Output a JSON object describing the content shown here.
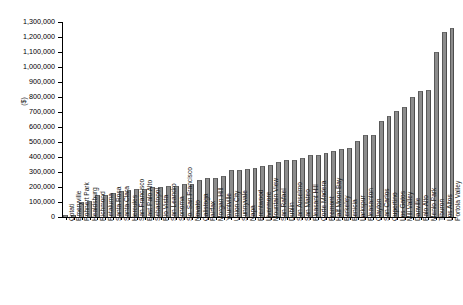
{
  "chart_data": {
    "type": "bar",
    "title": "",
    "subtitle": "",
    "xlabel": "",
    "ylabel": "($)",
    "ylim": [
      0,
      1300000
    ],
    "ytick_step": 100000,
    "grid": false,
    "legend": null,
    "bar_color": "#8c8c8c",
    "ytick_labels": [
      "1,300,000",
      "1,200,000",
      "1,100,000",
      "1,000,000",
      "900,000",
      "800,000",
      "700,000",
      "600,000",
      "500,000",
      "400,000",
      "300,000",
      "200,000",
      "100,000",
      "0"
    ],
    "ytick_values": [
      1300000,
      1200000,
      1100000,
      1000000,
      900000,
      800000,
      700000,
      600000,
      500000,
      400000,
      300000,
      200000,
      100000,
      0
    ],
    "categories": [
      "Cotati",
      "Emeryville",
      "Rohnert Park",
      "Healdsburg",
      "Richmond",
      "Petaluma",
      "Santa Rosa",
      "Santa Clara",
      "Hercules",
      "San Francisco",
      "East Palo Alto",
      "Sebastopol",
      "Rio Vista",
      "San Leandro",
      "Sonoma",
      "So. San Francisco",
      "Novato",
      "Calistoga",
      "Fairfax",
      "Morgan Hill",
      "Yountville",
      "Union City",
      "Sunnyvale",
      "Napa",
      "Brentwood",
      "Livermore",
      "Mountain View",
      "San Rafael",
      "Dublin",
      "San Anselmo",
      "San Mateo",
      "Pleasant Hill",
      "Corte Madera",
      "Fremont",
      "Half Moon Bay",
      "Berkeley",
      "Benicia",
      "Larkspur",
      "Pleasanton",
      "Clayton",
      "San Carlos",
      "Cupertino",
      "Los Gatos",
      "Mill Valley",
      "Danville",
      "Palo Alto",
      "Menlo Park",
      "Tiburon",
      "Los Altos",
      "Portola Valley"
    ],
    "values": [
      12000,
      15000,
      103000,
      107000,
      146000,
      150000,
      163000,
      176000,
      179000,
      185000,
      189000,
      197000,
      201000,
      205000,
      210000,
      219000,
      222000,
      248000,
      261000,
      262000,
      275000,
      311000,
      314000,
      322000,
      330000,
      337000,
      348000,
      367000,
      380000,
      383000,
      394000,
      412000,
      415000,
      424000,
      442000,
      456000,
      461000,
      506000,
      549000,
      548000,
      642000,
      675000,
      709000,
      731000,
      797000,
      839000,
      845000,
      1099000,
      1236000,
      1263000
    ]
  }
}
